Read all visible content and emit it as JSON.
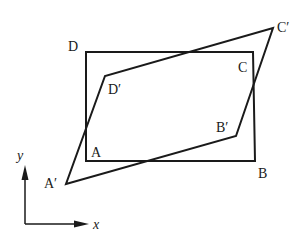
{
  "diagram": {
    "rectangle": {
      "name": "ABCD",
      "vertices": {
        "A": [
          86,
          161
        ],
        "B": [
          255,
          161
        ],
        "C": [
          253,
          52
        ],
        "D": [
          86,
          52
        ]
      },
      "labels": {
        "A": "A",
        "B": "B",
        "C": "C",
        "D": "D"
      }
    },
    "parallelogram": {
      "name": "A'B'C'D'",
      "vertices": {
        "A_prime": [
          66,
          184
        ],
        "B_prime": [
          236,
          136
        ],
        "C_prime": [
          273,
          28
        ],
        "D_prime": [
          105,
          76
        ]
      },
      "labels": {
        "A_prime": "A′",
        "B_prime": "B′",
        "C_prime": "C′",
        "D_prime": "D′"
      }
    },
    "axes": {
      "x_label": "x",
      "y_label": "y"
    },
    "colors": {
      "stroke": "#1a1a1a",
      "background": "#ffffff"
    }
  }
}
